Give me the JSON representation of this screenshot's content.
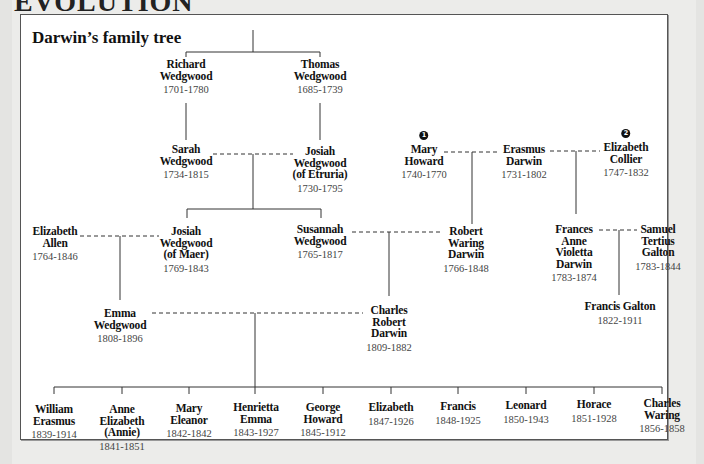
{
  "page": {
    "top_heading": "EVOLUTION",
    "title": "Darwin’s family tree"
  },
  "people": {
    "richard_wedgwood": {
      "name": [
        "Richard",
        "Wedgwood"
      ],
      "dates": "1701-1780"
    },
    "thomas_wedgwood": {
      "name": [
        "Thomas",
        "Wedgwood"
      ],
      "dates": "1685-1739"
    },
    "sarah_wedgwood": {
      "name": [
        "Sarah",
        "Wedgwood"
      ],
      "dates": "1734-1815"
    },
    "josiah_etruria": {
      "name": [
        "Josiah",
        "Wedgwood",
        "(of Etruria)"
      ],
      "dates": "1730-1795"
    },
    "mary_howard": {
      "badge": "1",
      "name": [
        "Mary",
        "Howard"
      ],
      "dates": "1740-1770"
    },
    "erasmus_darwin": {
      "name": [
        "Erasmus",
        "Darwin"
      ],
      "dates": "1731-1802"
    },
    "elizabeth_collier": {
      "badge": "2",
      "name": [
        "Elizabeth",
        "Collier"
      ],
      "dates": "1747-1832"
    },
    "elizabeth_allen": {
      "name": [
        "Elizabeth",
        "Allen"
      ],
      "dates": "1764-1846"
    },
    "josiah_maer": {
      "name": [
        "Josiah",
        "Wedgwood",
        "(of Maer)"
      ],
      "dates": "1769-1843"
    },
    "susannah_wedgwood": {
      "name": [
        "Susannah",
        "Wedgwood"
      ],
      "dates": "1765-1817"
    },
    "robert_waring_darwin": {
      "name": [
        "Robert",
        "Waring",
        "Darwin"
      ],
      "dates": "1766-1848"
    },
    "frances_anne_violetta": {
      "name": [
        "Frances",
        "Anne",
        "Violetta",
        "Darwin"
      ],
      "dates": "1783-1874"
    },
    "samuel_tertius_galton": {
      "name": [
        "Samuel",
        "Tertius",
        "Galton"
      ],
      "dates": "1783-1844"
    },
    "emma_wedgwood": {
      "name": [
        "Emma",
        "Wedgwood"
      ],
      "dates": "1808-1896"
    },
    "charles_robert_darwin": {
      "name": [
        "Charles",
        "Robert",
        "Darwin"
      ],
      "dates": "1809-1882"
    },
    "francis_galton": {
      "name": [
        "Francis Galton"
      ],
      "dates": "1822-1911"
    }
  },
  "children": [
    {
      "name": [
        "William",
        "Erasmus"
      ],
      "dates": "1839-1914"
    },
    {
      "name": [
        "Anne",
        "Elizabeth",
        "(Annie)"
      ],
      "dates": "1841-1851"
    },
    {
      "name": [
        "Mary",
        "Eleanor"
      ],
      "dates": "1842-1842"
    },
    {
      "name": [
        "Henrietta",
        "Emma"
      ],
      "dates": "1843-1927"
    },
    {
      "name": [
        "George",
        "Howard"
      ],
      "dates": "1845-1912"
    },
    {
      "name": [
        "Elizabeth"
      ],
      "dates": "1847-1926"
    },
    {
      "name": [
        "Francis"
      ],
      "dates": "1848-1925"
    },
    {
      "name": [
        "Leonard"
      ],
      "dates": "1850-1943"
    },
    {
      "name": [
        "Horace"
      ],
      "dates": "1851-1928"
    },
    {
      "name": [
        "Charles",
        "Waring"
      ],
      "dates": "1856-1858"
    }
  ],
  "colors": {
    "background": "#e4e4e2",
    "card": "#ffffff",
    "line": "#333333",
    "name_text": "#111111",
    "date_text": "#444444"
  }
}
